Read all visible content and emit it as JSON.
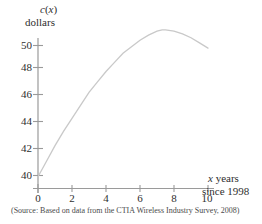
{
  "chart_data": {
    "type": "line",
    "title": "",
    "xlabel": "x years since 1998",
    "ylabel": "c(x) dollars",
    "xlim": [
      0,
      10.6
    ],
    "ylim": [
      39.3,
      51.8
    ],
    "grid": false,
    "legend": null,
    "x_ticks": [
      "0",
      "2",
      "4",
      "6",
      "8",
      "10"
    ],
    "x_tick_values": [
      0,
      2,
      4,
      6,
      8,
      10
    ],
    "y_ticks": [
      "40",
      "42",
      "44",
      "46",
      "48",
      "50"
    ],
    "y_tick_values": [
      40,
      42,
      44,
      46,
      48,
      50
    ],
    "series": [
      {
        "name": "c(x)",
        "x": [
          0,
          0.5,
          1,
          1.5,
          2,
          2.5,
          3,
          3.5,
          4,
          4.5,
          5,
          5.5,
          6,
          6.5,
          7,
          7.3,
          7.5,
          8,
          8.5,
          9,
          9.5,
          10
        ],
        "values": [
          39.9,
          41.1,
          42.3,
          43.4,
          44.4,
          45.4,
          46.4,
          47.2,
          48.0,
          48.7,
          49.4,
          49.9,
          50.4,
          50.8,
          51.1,
          51.2,
          51.2,
          51.1,
          50.9,
          50.6,
          50.2,
          49.8
        ]
      }
    ],
    "curve_color": "#c9c9c9",
    "axis_color": "#9a9a9a",
    "text_color": "#2e2e2e"
  },
  "ylabel": {
    "function_text": "c(x)",
    "function_c": "c",
    "function_open": "(",
    "function_x": "x",
    "function_close": ")",
    "units_text": "dollars"
  },
  "xlabel": {
    "var_text": "x",
    "years_text": "years",
    "since_text": "since 1998"
  },
  "source": {
    "text": "(Source: Based on data from the CTIA Wireless Industry Survey, 2008)"
  }
}
